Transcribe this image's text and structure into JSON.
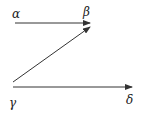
{
  "diagram": {
    "nodes": [
      {
        "id": "alpha",
        "label": "α",
        "x": 12,
        "y": 18
      },
      {
        "id": "beta",
        "label": "β",
        "x": 83,
        "y": 16
      },
      {
        "id": "gamma",
        "label": "γ",
        "x": 9,
        "y": 107
      },
      {
        "id": "delta",
        "label": "δ",
        "x": 126,
        "y": 104
      }
    ],
    "edges": [
      {
        "from": "alpha",
        "to": "beta",
        "x1": 15,
        "y1": 23,
        "x2": 90,
        "y2": 23
      },
      {
        "from": "gamma",
        "to": "beta",
        "x1": 13,
        "y1": 82,
        "x2": 90,
        "y2": 27
      },
      {
        "from": "gamma",
        "to": "delta",
        "x1": 13,
        "y1": 87,
        "x2": 132,
        "y2": 87
      }
    ],
    "colors": {
      "line": "#333333",
      "text": "#222222",
      "background": "#ffffff"
    }
  }
}
